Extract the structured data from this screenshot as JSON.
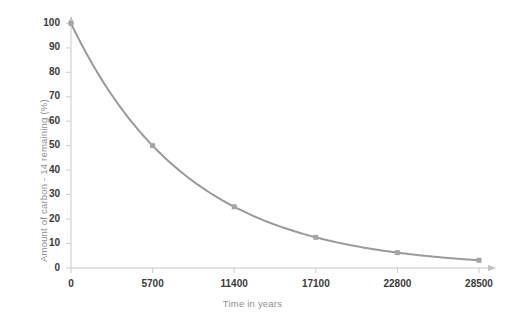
{
  "chart_data": {
    "type": "line",
    "title": "",
    "subtitle": "",
    "xlabel": "Time in years",
    "ylabel": "Amount of carbon - 14 remaining   (%)",
    "x": [
      0,
      5700,
      11400,
      17100,
      22800,
      28500
    ],
    "values": [
      100,
      50,
      25,
      12.5,
      6.25,
      3.125
    ],
    "series": [
      {
        "name": "Carbon-14 remaining",
        "values": [
          100,
          50,
          25,
          12.5,
          6.25,
          3.125
        ]
      }
    ],
    "xtick_labels": [
      "0",
      "5700",
      "11400",
      "17100",
      "22800",
      "28500"
    ],
    "xtick_values": [
      0,
      5700,
      11400,
      17100,
      22800,
      28500
    ],
    "ytick_labels": [
      "0",
      "10",
      "20",
      "30",
      "40",
      "50",
      "60",
      "70",
      "80",
      "90",
      "100"
    ],
    "ytick_values": [
      0,
      10,
      20,
      30,
      40,
      50,
      60,
      70,
      80,
      90,
      100
    ],
    "xlim": [
      0,
      28500
    ],
    "ylim": [
      0,
      100
    ],
    "grid": false,
    "legend": false,
    "legend_position": "none",
    "half_life_years": 5700,
    "annotations": [],
    "colors": {
      "line": "#9a9a9a",
      "marker": "#a5a5a5",
      "axis": "#c4c4c4",
      "tick_text": "#3a3a3a",
      "axis_title_text": "#8f8f8f",
      "background": "#ffffff"
    }
  },
  "axis_titles": {
    "y": "Amount of carbon - 14 remaining   (%)",
    "x": "Time in years"
  },
  "y_ticks": [
    {
      "label": "100"
    },
    {
      "label": "90"
    },
    {
      "label": "80"
    },
    {
      "label": "70"
    },
    {
      "label": "60"
    },
    {
      "label": "50"
    },
    {
      "label": "40"
    },
    {
      "label": "30"
    },
    {
      "label": "20"
    },
    {
      "label": "10"
    },
    {
      "label": "0"
    }
  ],
  "x_ticks": [
    {
      "label": "0"
    },
    {
      "label": "5700"
    },
    {
      "label": "11400"
    },
    {
      "label": "17100"
    },
    {
      "label": "22800"
    },
    {
      "label": "28500"
    }
  ]
}
